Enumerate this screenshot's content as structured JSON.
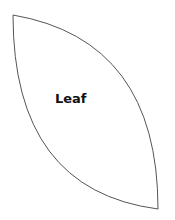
{
  "diagram": {
    "shape": {
      "type": "leaf",
      "label": "Leaf",
      "stroke": "#555555",
      "fill": "#ffffff",
      "tip_top_left": [
        13,
        15
      ],
      "tip_bottom_right": [
        158,
        209
      ]
    }
  }
}
